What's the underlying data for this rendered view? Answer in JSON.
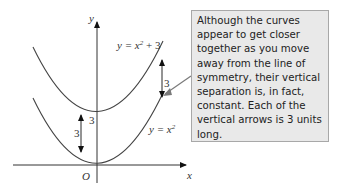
{
  "diagram": {
    "axes": {
      "x_label": "x",
      "y_label": "y",
      "origin_label": "O"
    },
    "curves": [
      {
        "name": "upper",
        "label": "y = x² + 3",
        "label_parts": {
          "base": "y = x",
          "exp": "2",
          "tail": " + 3"
        }
      },
      {
        "name": "lower",
        "label": "y = x²",
        "label_parts": {
          "base": "y = x",
          "exp": "2"
        }
      }
    ],
    "arrows": [
      {
        "position": "left",
        "length_label": "3"
      },
      {
        "position": "right",
        "length_label": "3"
      }
    ],
    "intercept_label": "3",
    "callout": {
      "text": "Although the curves appear to get closer together as you move away from the line of symmetry, their vertical separation is, in fact, constant. Each of the vertical arrows is 3 units long."
    },
    "colors": {
      "curve": "#444444",
      "axis": "#333333",
      "callout_bg": "#e9e9e9",
      "callout_border": "#a8a8a8",
      "pointer": "#7a7a7a"
    }
  }
}
